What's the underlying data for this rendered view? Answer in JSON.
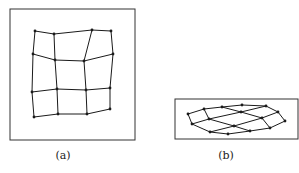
{
  "figure": {
    "panels": [
      {
        "id": "a",
        "label": "(a)",
        "label_pos": [
          63,
          149
        ],
        "frame": {
          "x": 10,
          "y": 9,
          "w": 125,
          "h": 131
        },
        "grid_rows": [
          [
            [
              35,
              31
            ],
            [
              54,
              34
            ],
            [
              92,
              30
            ],
            [
              111,
              31
            ]
          ],
          [
            [
              33,
              54
            ],
            [
              55,
              60
            ],
            [
              84,
              61
            ],
            [
              113,
              54
            ]
          ],
          [
            [
              32,
              92
            ],
            [
              57,
              89
            ],
            [
              86,
              90
            ],
            [
              110,
              88
            ]
          ],
          [
            [
              34,
              117
            ],
            [
              58,
              114
            ],
            [
              87,
              114
            ],
            [
              110,
              109
            ]
          ]
        ]
      },
      {
        "id": "b",
        "label": "(b)",
        "label_pos": [
          226,
          149
        ],
        "frame": {
          "x": 175,
          "y": 99,
          "w": 123,
          "h": 40
        },
        "grid_rows": [
          [
            [
              188,
              114
            ],
            [
              204,
              109
            ],
            [
              222,
              107
            ],
            [
              242,
              105
            ]
          ],
          [
            [
              192,
              124
            ],
            [
              209,
              119
            ],
            [
              241,
              112
            ],
            [
              266,
              106
            ]
          ],
          [
            [
              210,
              132
            ],
            [
              234,
              126
            ],
            [
              262,
              118
            ],
            [
              278,
              112
            ]
          ],
          [
            [
              228,
              134
            ],
            [
              250,
              131
            ],
            [
              270,
              128
            ],
            [
              285,
              121
            ]
          ]
        ]
      }
    ],
    "stroke_color": "#1a1a1a",
    "frame_color": "#333333"
  }
}
